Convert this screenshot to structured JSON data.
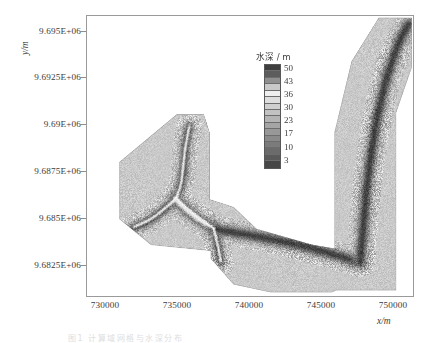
{
  "figure": {
    "type": "map-contour",
    "caption": "图1  计算域网格与水深分布",
    "frame_color": "#9a9a9a",
    "background": "#ffffff"
  },
  "axes": {
    "x_axis_title": "x/m",
    "y_axis_title": "y/m",
    "x_ticks": [
      "730000",
      "735000",
      "740000",
      "745000",
      "750000"
    ],
    "y_ticks": [
      "9.695E+06",
      "9.6925E+06",
      "9.69E+06",
      "9.6875E+06",
      "9.685E+06",
      "9.6825E+06"
    ],
    "x_range": [
      728700,
      751600
    ],
    "y_range": [
      9681700,
      9695900
    ]
  },
  "legend": {
    "title": "水深 / m",
    "tick_labels": [
      "50",
      "43",
      "36",
      "30",
      "23",
      "17",
      "10",
      "3"
    ],
    "band_colors": [
      "#3f3f3f",
      "#5c5c5c",
      "#8f8f8f",
      "#c9c9c9",
      "#efefef",
      "#dedede",
      "#cfcfcf",
      "#c2c2c2",
      "#b4b4b4",
      "#a5a5a5",
      "#989898",
      "#8a8a8a",
      "#7b7b7b",
      "#6b6b6b",
      "#5a5a5a",
      "#474747"
    ]
  },
  "chart_data": {
    "type": "heatmap",
    "title": "",
    "xlabel": "x/m",
    "ylabel": "y/m",
    "xlim": [
      728700,
      751600
    ],
    "ylim": [
      9681700,
      9695900
    ],
    "grid": false,
    "legend_position": "inside-top-center",
    "colorbar_label": "水深 / m",
    "colorbar_ticks": [
      50,
      43,
      36,
      30,
      23,
      17,
      10,
      3
    ],
    "colorbar_range": [
      3,
      50
    ],
    "variable": "水深",
    "units": "m",
    "xtick_values": [
      730000,
      735000,
      740000,
      745000,
      750000
    ],
    "ytick_values": [
      9695000,
      9692500,
      9690000,
      9687500,
      9685000,
      9682500
    ],
    "mesh": {
      "style": "unstructured-triangular-speckle",
      "base_tone": "#9d9d9d"
    },
    "domain_polygon": [
      [
        735000,
        9690900
      ],
      [
        736900,
        9690900
      ],
      [
        737300,
        9690000
      ],
      [
        737300,
        9686600
      ],
      [
        739000,
        9686200
      ],
      [
        740600,
        9685100
      ],
      [
        744500,
        9684300
      ],
      [
        746100,
        9684100
      ],
      [
        746100,
        9686400
      ],
      [
        746100,
        9690000
      ],
      [
        747300,
        9693600
      ],
      [
        749200,
        9695800
      ],
      [
        751500,
        9695800
      ],
      [
        751500,
        9693300
      ],
      [
        750400,
        9691000
      ],
      [
        750400,
        9686000
      ],
      [
        750400,
        9682000
      ],
      [
        746200,
        9682000
      ],
      [
        745900,
        9681900
      ],
      [
        741600,
        9681900
      ],
      [
        739000,
        9682300
      ],
      [
        737400,
        9683600
      ],
      [
        737400,
        9684000
      ],
      [
        733200,
        9684300
      ],
      [
        731000,
        9685600
      ],
      [
        731000,
        9688500
      ]
    ],
    "channels": [
      {
        "name": "northwest-tributary",
        "depth_class": "deep",
        "path": [
          [
            735900,
            9690300
          ],
          [
            735600,
            9689300
          ],
          [
            735500,
            9688200
          ],
          [
            735300,
            9687300
          ],
          [
            734900,
            9686600
          ]
        ]
      },
      {
        "name": "west-tributary",
        "depth_class": "deep",
        "path": [
          [
            731800,
            9685100
          ],
          [
            733100,
            9685500
          ],
          [
            734000,
            9686000
          ],
          [
            734900,
            9686600
          ]
        ]
      },
      {
        "name": "central-confluence",
        "depth_class": "deepest",
        "path": [
          [
            734900,
            9686600
          ],
          [
            735600,
            9686100
          ],
          [
            736500,
            9685600
          ],
          [
            737600,
            9685100
          ]
        ]
      },
      {
        "name": "south-tributary",
        "depth_class": "deep",
        "path": [
          [
            737600,
            9685100
          ],
          [
            737900,
            9684200
          ],
          [
            738100,
            9683400
          ]
        ]
      },
      {
        "name": "main-east-channel",
        "depth_class": "deep",
        "path": [
          [
            737600,
            9685100
          ],
          [
            740000,
            9684800
          ],
          [
            743000,
            9684400
          ],
          [
            745600,
            9683900
          ],
          [
            747900,
            9683400
          ]
        ]
      },
      {
        "name": "northeast-main-channel",
        "depth_class": "deep",
        "path": [
          [
            747900,
            9683400
          ],
          [
            748100,
            9685200
          ],
          [
            748400,
            9687600
          ],
          [
            748900,
            9690100
          ],
          [
            749600,
            9692500
          ],
          [
            750600,
            9694600
          ],
          [
            751300,
            9695500
          ]
        ]
      }
    ]
  }
}
